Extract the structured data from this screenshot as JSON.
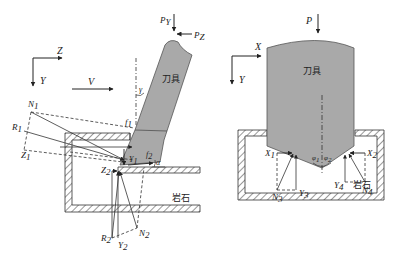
{
  "colors": {
    "tool_fill": "#a9a9a9",
    "tool_stroke": "#555555",
    "line": "#333333",
    "hatch": "#444444",
    "background": "#ffffff"
  },
  "left_panel": {
    "axes": {
      "horizontal": "Z",
      "vertical": "Y"
    },
    "velocity_label": "V",
    "tool_label": "刀具",
    "rock_label": "岩石",
    "loads": {
      "vertical": "P",
      "vertical_sub": "Y",
      "horizontal": "P",
      "horizontal_sub": "Z"
    },
    "angles": {
      "rake": "γ",
      "clearance": "α"
    },
    "forces": [
      {
        "name": "N",
        "sub": "1"
      },
      {
        "name": "R",
        "sub": "1"
      },
      {
        "name": "Z",
        "sub": "1"
      },
      {
        "name": "f",
        "sub": "1"
      },
      {
        "name": "Y",
        "sub": "1"
      },
      {
        "name": "f",
        "sub": "2"
      },
      {
        "name": "Z",
        "sub": "2"
      },
      {
        "name": "R",
        "sub": "2"
      },
      {
        "name": "Y",
        "sub": "2"
      },
      {
        "name": "N",
        "sub": "2"
      }
    ]
  },
  "right_panel": {
    "axes": {
      "horizontal": "X",
      "vertical": "Y"
    },
    "load_label": "P",
    "tool_label": "刀具",
    "rock_label": "岩石",
    "angles": [
      {
        "name": "φ",
        "sub": "1"
      },
      {
        "name": "φ",
        "sub": "2"
      }
    ],
    "forces": [
      {
        "name": "X",
        "sub": "1"
      },
      {
        "name": "N",
        "sub": "3"
      },
      {
        "name": "Y",
        "sub": "3"
      },
      {
        "name": "X",
        "sub": "2"
      },
      {
        "name": "Y",
        "sub": "4"
      },
      {
        "name": "N",
        "sub": "4"
      }
    ]
  }
}
